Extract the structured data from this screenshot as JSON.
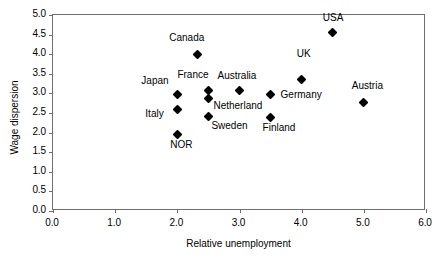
{
  "chart_data": {
    "type": "scatter",
    "title": "",
    "xlabel": "Relative unemployment",
    "ylabel": "Wage dispersion",
    "xlim": [
      0.0,
      6.0
    ],
    "ylim": [
      0.0,
      5.0
    ],
    "xticks": [
      "0.0",
      "1.0",
      "2.0",
      "3.0",
      "4.0",
      "5.0",
      "6.0"
    ],
    "yticks": [
      "0.0",
      "0.5",
      "1.0",
      "1.5",
      "2.0",
      "2.5",
      "3.0",
      "3.5",
      "4.0",
      "4.5",
      "5.0"
    ],
    "grid": false,
    "legend": false,
    "marker_color": "#000000",
    "marker_shape": "diamond",
    "points": [
      {
        "label": "Japan",
        "x": 2.0,
        "y": 2.98,
        "label_dx": -36,
        "label_dy": -14
      },
      {
        "label": "Italy",
        "x": 2.0,
        "y": 2.6,
        "label_dx": -32,
        "label_dy": 4
      },
      {
        "label": "NOR",
        "x": 2.0,
        "y": 1.96,
        "label_dx": -7,
        "label_dy": 10
      },
      {
        "label": "Canada",
        "x": 2.32,
        "y": 3.98,
        "label_dx": -28,
        "label_dy": -18
      },
      {
        "label": "France",
        "x": 2.5,
        "y": 3.08,
        "label_dx": -31,
        "label_dy": -16
      },
      {
        "label": "Netherland",
        "x": 2.5,
        "y": 2.87,
        "label_dx": 5,
        "label_dy": 7
      },
      {
        "label": "Sweden",
        "x": 2.5,
        "y": 2.4,
        "label_dx": 3,
        "label_dy": 8
      },
      {
        "label": "Australia",
        "x": 3.0,
        "y": 3.07,
        "label_dx": -22,
        "label_dy": -16
      },
      {
        "label": "Germany",
        "x": 3.5,
        "y": 2.97,
        "label_dx": 10,
        "label_dy": -1
      },
      {
        "label": "Finland",
        "x": 3.5,
        "y": 2.38,
        "label_dx": -8,
        "label_dy": 9
      },
      {
        "label": "UK",
        "x": 4.0,
        "y": 3.36,
        "label_dx": -5,
        "label_dy": -26
      },
      {
        "label": "USA",
        "x": 4.5,
        "y": 4.55,
        "label_dx": -10,
        "label_dy": -16
      },
      {
        "label": "Austria",
        "x": 5.0,
        "y": 2.77,
        "label_dx": -12,
        "label_dy": -17
      }
    ]
  }
}
